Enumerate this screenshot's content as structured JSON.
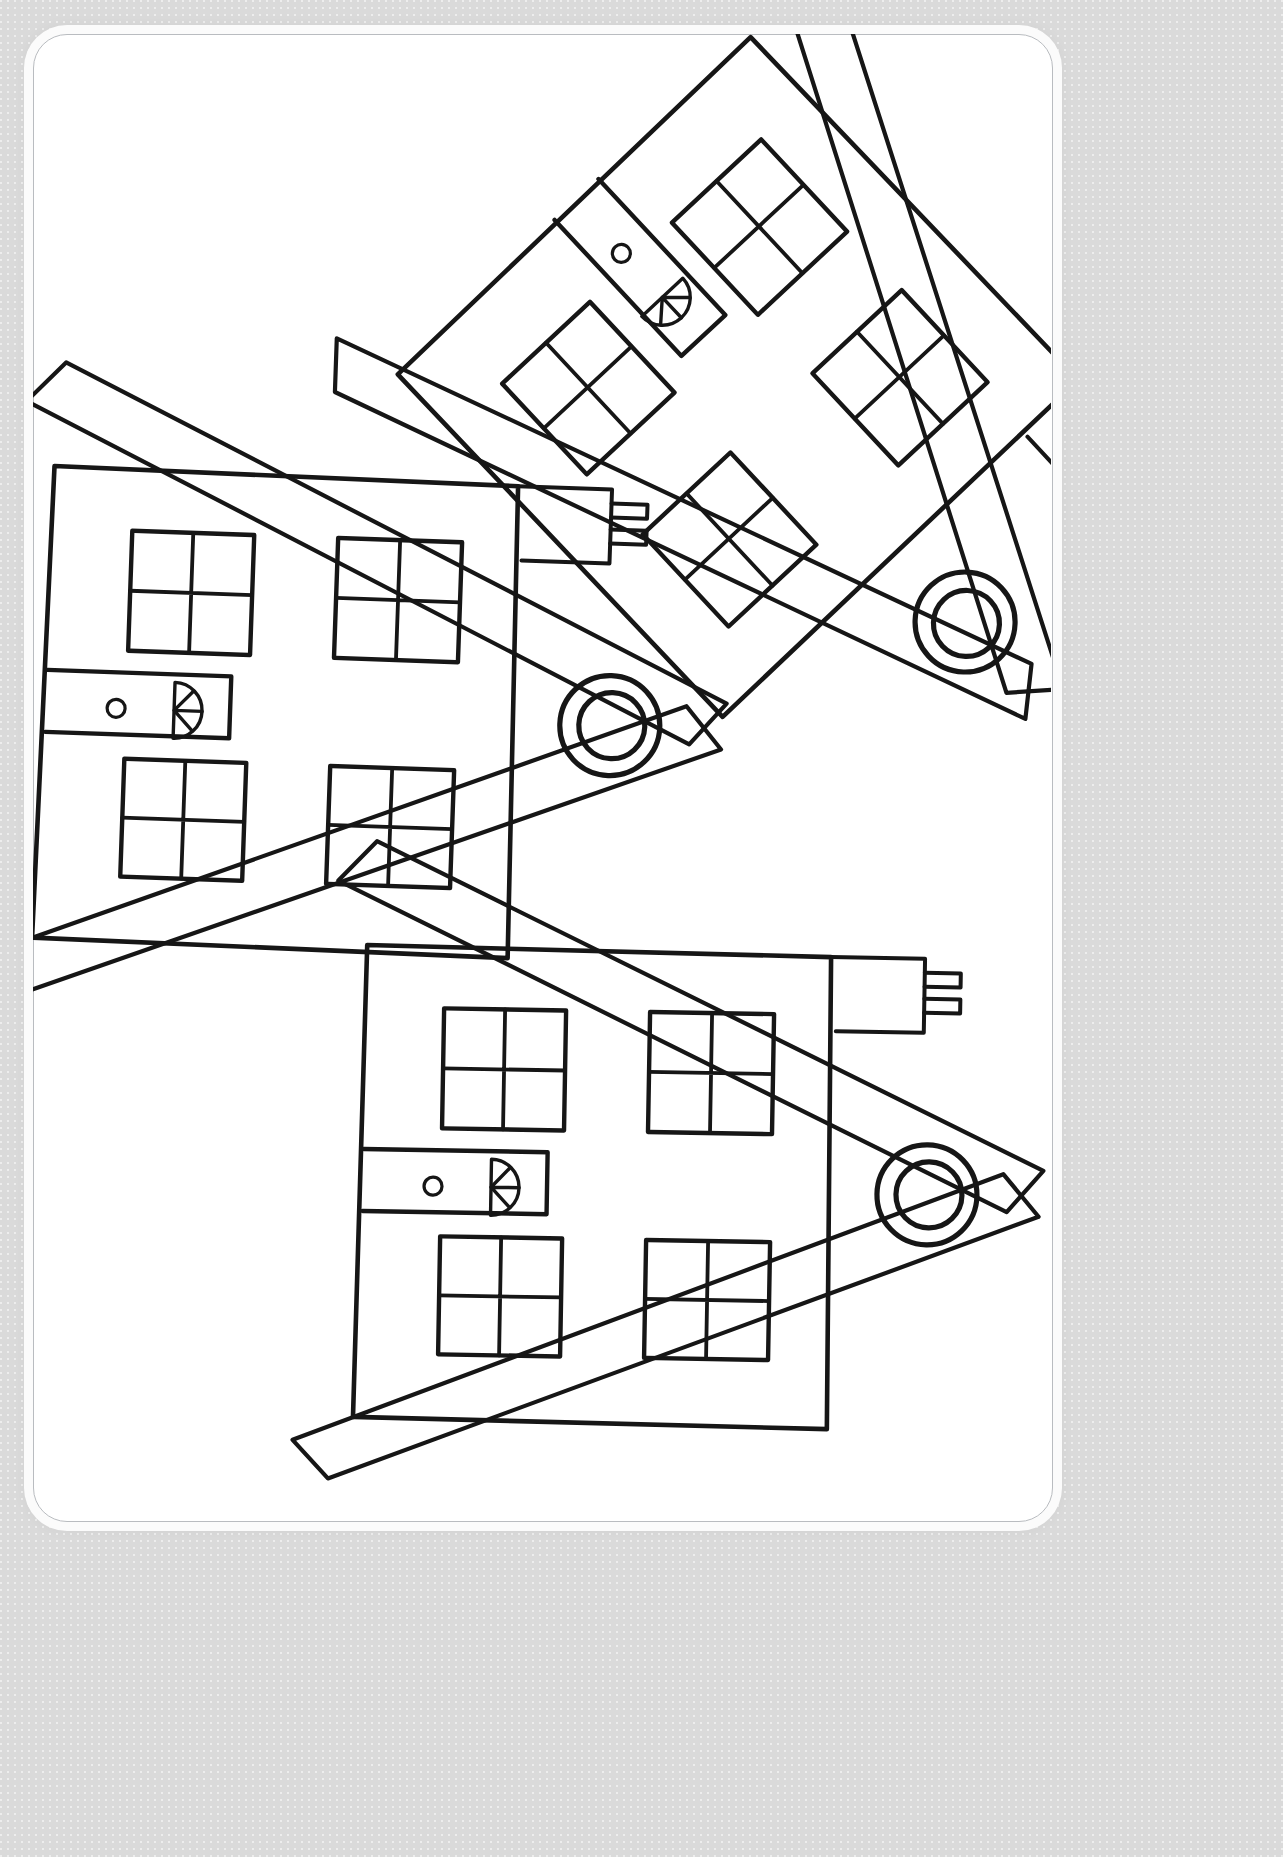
{
  "page": {
    "background_color": "#d9d9d9",
    "sheet_color": "#ffffff",
    "sheet_border_color": "#b9bcc0",
    "ink_color": "#161616",
    "style": "hand-drawn black outline, uncolored"
  },
  "artwork": {
    "kind": "line-drawing",
    "subject": "house",
    "copies": 3,
    "description": "Three identical outline houses drawn at different rotations on a white rounded card."
  },
  "house_template": {
    "parts": [
      {
        "name": "house-body",
        "shape": "quadrilateral wall block"
      },
      {
        "name": "roof",
        "shape": "two thick parallel-line beams meeting at a peak (chevron)"
      },
      {
        "name": "attic-vent",
        "shape": "double concentric circle"
      },
      {
        "name": "chimney",
        "shape": "rectangle with two short prongs at the end"
      },
      {
        "name": "door",
        "shape": "tall rectangle"
      },
      {
        "name": "door-knob",
        "shape": "small circle"
      },
      {
        "name": "door-fan-light",
        "shape": "half-circle with four radiating spokes"
      },
      {
        "name": "window",
        "shape": "square divided into four panes",
        "count_per_house": 4
      }
    ],
    "window_panes": 4
  },
  "houses": [
    {
      "id": "house-1",
      "label": "top-right house",
      "rotation_deg": -45,
      "roof_direction": "down-right",
      "position": {
        "x": 0.62,
        "y": 0.19
      }
    },
    {
      "id": "house-2",
      "label": "left house",
      "rotation_deg": -90,
      "roof_direction": "right",
      "position": {
        "x": 0.32,
        "y": 0.46
      }
    },
    {
      "id": "house-3",
      "label": "bottom house",
      "rotation_deg": -90,
      "roof_direction": "right",
      "position": {
        "x": 0.62,
        "y": 0.79
      }
    }
  ]
}
